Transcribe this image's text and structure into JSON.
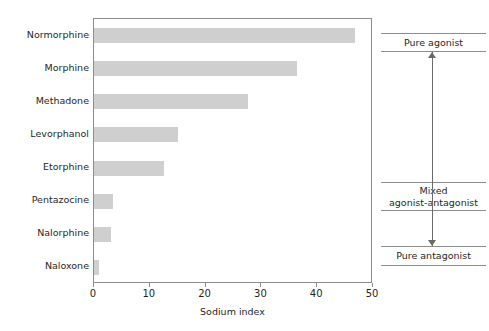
{
  "chart_data": {
    "type": "bar",
    "orientation": "horizontal",
    "title": "",
    "xlabel": "Sodium index",
    "ylabel": "",
    "xlim": [
      0,
      50
    ],
    "xticks": [
      0,
      10,
      20,
      30,
      40,
      50
    ],
    "xtick_labels": [
      "0",
      "10",
      "20",
      "30",
      "40",
      "50"
    ],
    "grid": false,
    "legend": null,
    "bar_color": "#cfcfcf",
    "categories": [
      "Normorphine",
      "Morphine",
      "Methadone",
      "Levorphanol",
      "Etorphine",
      "Pentazocine",
      "Nalorphine",
      "Naloxone"
    ],
    "values": [
      46.8,
      36.4,
      27.6,
      15.0,
      12.5,
      3.4,
      3.0,
      0.9
    ],
    "annotations": [
      {
        "label": "Pure agonist",
        "lines": [
          "Pure agonist"
        ]
      },
      {
        "label": "Mixed agonist-antagonist",
        "lines": [
          "Mixed",
          "agonist-antagonist"
        ]
      },
      {
        "label": "Pure antagonist",
        "lines": [
          "Pure antagonist"
        ]
      }
    ],
    "annotation_arrow": "double-headed vertical arrow spanning pure agonist to pure antagonist"
  },
  "axis": {
    "x_title": "Sodium index"
  },
  "annotations": {
    "pure_agonist": "Pure agonist",
    "mixed_line1": "Mixed",
    "mixed_line2": "agonist-antagonist",
    "pure_antagonist": "Pure antagonist"
  }
}
